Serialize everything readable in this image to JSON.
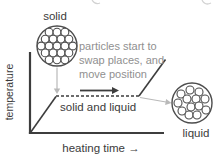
{
  "labels": {
    "solid": "solid",
    "liquid": "liquid",
    "solid_and_liquid": "solid and liquid",
    "temperature_axis": "temperature",
    "heating_time_axis": "heating time →"
  },
  "annotation": {
    "lines": [
      "particles start to",
      "swap places, and",
      "move position"
    ]
  },
  "colors": {
    "line": "#3d3d3d",
    "text": "#3b3b3b",
    "annotation_text": "#909090",
    "connector": "#b9b9b9",
    "particle": "#4d4d4d",
    "background": "#ffffff"
  },
  "particles": {
    "solid": {
      "outer_cx": 57,
      "outer_cy": 46,
      "outer_r": 20,
      "r": 3.9,
      "points": [
        [
          49.1,
          32.2
        ],
        [
          57,
          32.2
        ],
        [
          64.9,
          32.2
        ],
        [
          45.2,
          39.1
        ],
        [
          53.1,
          39.1
        ],
        [
          61,
          39.1
        ],
        [
          68.9,
          39.1
        ],
        [
          41.2,
          46
        ],
        [
          49.1,
          46
        ],
        [
          57,
          46
        ],
        [
          64.9,
          46
        ],
        [
          72.8,
          46
        ],
        [
          45.2,
          52.9
        ],
        [
          53.1,
          52.9
        ],
        [
          61,
          52.9
        ],
        [
          68.9,
          52.9
        ],
        [
          49.1,
          59.8
        ],
        [
          57,
          59.8
        ],
        [
          64.9,
          59.8
        ]
      ]
    },
    "liquid": {
      "outer_cx": 192,
      "outer_cy": 103,
      "outer_r": 20,
      "r": 4,
      "points": [
        [
          181,
          94
        ],
        [
          190,
          90
        ],
        [
          199,
          92
        ],
        [
          178,
          103
        ],
        [
          187,
          99
        ],
        [
          196,
          99
        ],
        [
          205,
          99
        ],
        [
          182,
          111
        ],
        [
          191,
          107
        ],
        [
          199,
          106
        ],
        [
          206,
          110
        ],
        [
          189,
          115
        ],
        [
          197,
          115
        ]
      ]
    }
  }
}
